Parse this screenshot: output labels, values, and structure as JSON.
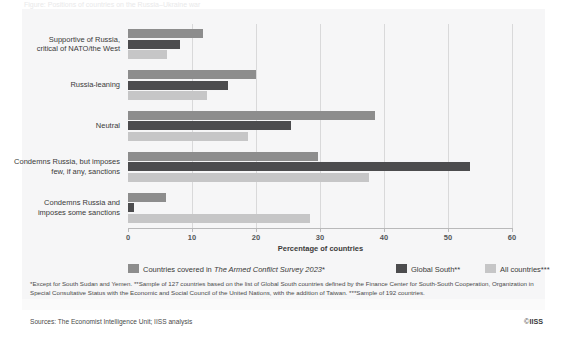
{
  "figure": {
    "clipped_title": "Figure: Positions of countries on the Russia–Ukraine war",
    "axis_title": "Percentage of countries",
    "sources": "Sources: The Economist Intelligence Unit; IISS analysis",
    "copyright_prefix": "©",
    "copyright_mark": "IISS",
    "notes": "*Except for South Sudan and Yemen. **Sample of 127 countries based on the list of Global South countries defined by the Finance Center for South-South Cooperation, Organization in Special Consultative Status with the Economic and Social Council of the United Nations, with the addition of Taiwan. ***Sample of 192 countries."
  },
  "legend": [
    {
      "label_before": "Countries covered in ",
      "label_italic": "The Armed Conflict Survey 2023",
      "label_after": "*",
      "color": "#8d8d8d"
    },
    {
      "label_before": "Global South**",
      "label_italic": "",
      "label_after": "",
      "color": "#4c4c4e"
    },
    {
      "label_before": "All countries***",
      "label_italic": "",
      "label_after": "",
      "color": "#c6c6c7"
    }
  ],
  "chart_data": {
    "type": "bar",
    "orientation": "horizontal",
    "title": "",
    "xlabel": "Percentage of countries",
    "ylabel": "",
    "xlim": [
      0,
      60
    ],
    "xticks": [
      0,
      10,
      20,
      30,
      40,
      50,
      60
    ],
    "grid": true,
    "legend_position": "bottom",
    "categories": [
      "Supportive of Russia, critical of NATO/the West",
      "Russia-leaning",
      "Neutral",
      "Condemns Russia, but imposes few, if any, sanctions",
      "Condemns Russia and imposes some sanctions"
    ],
    "category_lines": [
      [
        "Supportive of Russia,",
        "critical of NATO/the West"
      ],
      [
        "Russia-leaning"
      ],
      [
        "Neutral"
      ],
      [
        "Condemns Russia, but imposes",
        "few, if any, sanctions"
      ],
      [
        "Condemns Russia and",
        "imposes some sanctions"
      ]
    ],
    "series": [
      {
        "name": "Countries covered in The Armed Conflict Survey 2023*",
        "color": "#8d8d8d",
        "values": [
          11.7,
          20.0,
          38.6,
          29.7,
          5.9
        ]
      },
      {
        "name": "Global South**",
        "color": "#4c4c4e",
        "values": [
          8.1,
          15.6,
          25.5,
          53.4,
          1.0
        ]
      },
      {
        "name": "All countries***",
        "color": "#c6c6c7",
        "values": [
          6.1,
          12.3,
          18.8,
          37.7,
          28.4
        ]
      }
    ]
  }
}
